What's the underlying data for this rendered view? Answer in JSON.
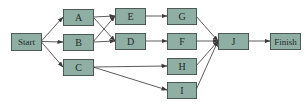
{
  "colors": {
    "node_fill": "#8fafa5",
    "node_stroke": "#4b5a55",
    "edge": "#4a4a4a",
    "text": "#1f2a27"
  },
  "nodes": [
    {
      "id": "start",
      "label": "Start",
      "x": 11,
      "y": 33,
      "w": 30,
      "h": 17
    },
    {
      "id": "A",
      "label": "A",
      "x": 63,
      "y": 9,
      "w": 30,
      "h": 16
    },
    {
      "id": "B",
      "label": "B",
      "x": 63,
      "y": 34,
      "w": 30,
      "h": 16
    },
    {
      "id": "C",
      "label": "C",
      "x": 63,
      "y": 59,
      "w": 30,
      "h": 16
    },
    {
      "id": "E",
      "label": "E",
      "x": 115,
      "y": 8,
      "w": 30,
      "h": 16
    },
    {
      "id": "D",
      "label": "D",
      "x": 115,
      "y": 33,
      "w": 30,
      "h": 16
    },
    {
      "id": "G",
      "label": "G",
      "x": 167,
      "y": 8,
      "w": 29,
      "h": 16
    },
    {
      "id": "F",
      "label": "F",
      "x": 167,
      "y": 33,
      "w": 29,
      "h": 16
    },
    {
      "id": "H",
      "label": "H",
      "x": 167,
      "y": 58,
      "w": 29,
      "h": 16
    },
    {
      "id": "I",
      "label": "I",
      "x": 167,
      "y": 82,
      "w": 29,
      "h": 16
    },
    {
      "id": "J",
      "label": "J",
      "x": 218,
      "y": 33,
      "w": 30,
      "h": 16
    },
    {
      "id": "finish",
      "label": "Finish",
      "x": 270,
      "y": 33,
      "w": 30,
      "h": 16
    }
  ],
  "edges": [
    {
      "from": "start",
      "to": "A"
    },
    {
      "from": "start",
      "to": "B"
    },
    {
      "from": "start",
      "to": "C"
    },
    {
      "from": "A",
      "to": "E"
    },
    {
      "from": "A",
      "to": "D"
    },
    {
      "from": "B",
      "to": "E"
    },
    {
      "from": "B",
      "to": "D"
    },
    {
      "from": "E",
      "to": "G"
    },
    {
      "from": "D",
      "to": "F"
    },
    {
      "from": "C",
      "to": "H"
    },
    {
      "from": "C",
      "to": "I"
    },
    {
      "from": "G",
      "to": "J"
    },
    {
      "from": "F",
      "to": "J"
    },
    {
      "from": "H",
      "to": "J"
    },
    {
      "from": "I",
      "to": "J"
    },
    {
      "from": "J",
      "to": "finish"
    }
  ]
}
